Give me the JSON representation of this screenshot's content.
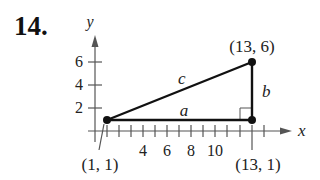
{
  "problem": {
    "number": "14."
  },
  "axes": {
    "x_label": "x",
    "y_label": "y",
    "x_ticks": [
      "4",
      "6",
      "8",
      "10"
    ],
    "y_ticks": [
      "2",
      "4",
      "6"
    ]
  },
  "triangle": {
    "vertices": [
      {
        "label": "(1, 1)",
        "x": 1,
        "y": 1
      },
      {
        "label": "(13, 1)",
        "x": 13,
        "y": 1
      },
      {
        "label": "(13, 6)",
        "x": 13,
        "y": 6
      }
    ],
    "sides": {
      "a": "a",
      "b": "b",
      "c": "c"
    }
  },
  "colors": {
    "axis": "#555555",
    "triangle": "#111111"
  }
}
